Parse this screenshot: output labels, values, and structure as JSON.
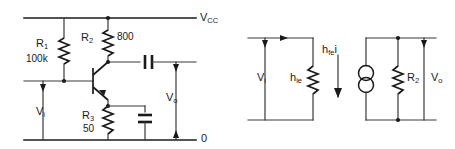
{
  "figure": {
    "background_color": "#ffffff",
    "line_color": "#1a1a1a"
  },
  "left_circuit": {
    "name": "common-emitter-amplifier",
    "supply_rail_label": "V",
    "supply_rail_sub": "CC",
    "ground_rail_label": "0",
    "input_label": "V",
    "input_sub": "i",
    "output_label": "V",
    "output_sub": "o",
    "components": [
      {
        "ref": "R",
        "ref_sub": "1",
        "value": "100k",
        "type": "resistor",
        "role": "base-bias-resistor"
      },
      {
        "ref": "R",
        "ref_sub": "2",
        "value": "800",
        "type": "resistor",
        "role": "collector-load-resistor"
      },
      {
        "ref": "R",
        "ref_sub": "3",
        "value": "50",
        "type": "resistor",
        "role": "emitter-resistor"
      },
      {
        "ref": "",
        "ref_sub": "",
        "value": "",
        "type": "capacitor",
        "role": "output-coupling-capacitor"
      },
      {
        "ref": "",
        "ref_sub": "",
        "value": "",
        "type": "capacitor",
        "role": "emitter-bypass-capacitor"
      },
      {
        "ref": "",
        "ref_sub": "",
        "value": "",
        "type": "transistor-npn",
        "role": "amplifying-transistor"
      }
    ]
  },
  "right_circuit": {
    "name": "h-parameter-equivalent-circuit",
    "input_label": "V",
    "input_sub": "i",
    "output_label": "V",
    "output_sub": "o",
    "input_resistance_label": "h",
    "input_resistance_sub": "ie",
    "current_source_label": "h",
    "current_source_sub": "fe",
    "current_source_suffix": "i",
    "load_label": "R",
    "load_sub": "2",
    "components": [
      {
        "ref": "h",
        "ref_sub": "ie",
        "type": "resistor",
        "role": "input-resistance"
      },
      {
        "ref": "h",
        "ref_sub": "fe",
        "type": "current-source",
        "role": "dependent-current-source"
      },
      {
        "ref": "R",
        "ref_sub": "2",
        "type": "resistor",
        "role": "load-resistor"
      }
    ]
  }
}
